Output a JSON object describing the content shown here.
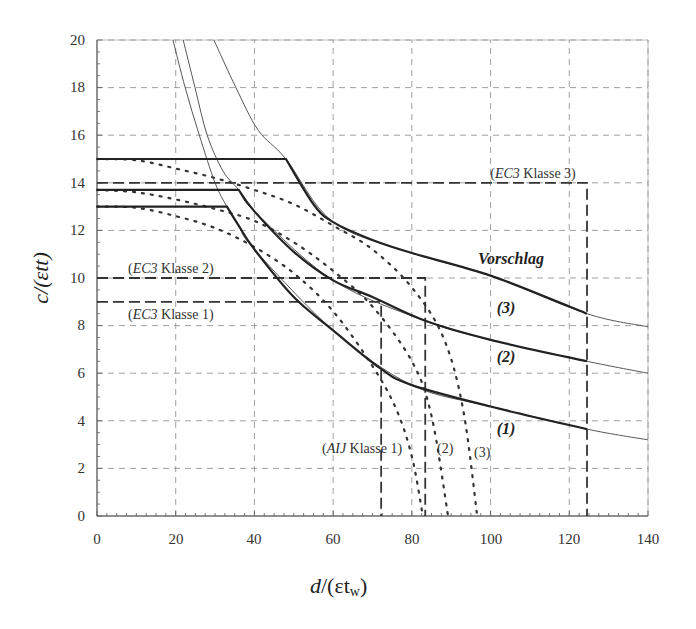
{
  "chart_data": {
    "type": "line",
    "title": "",
    "xlabel": "d/(ε t_w)",
    "ylabel": "c/(ε t f)",
    "xlim": [
      0,
      140
    ],
    "ylim": [
      0,
      20
    ],
    "xticks": [
      0,
      20,
      40,
      60,
      80,
      100,
      120,
      140
    ],
    "yticks": [
      0,
      2,
      4,
      6,
      8,
      10,
      12,
      14,
      16,
      18,
      20
    ],
    "grid": true,
    "legend": "none (inline annotations)",
    "series": [
      {
        "name": "Vorschlag (1)",
        "style": "thick solid",
        "x": [
          0,
          33,
          36,
          40,
          50,
          60,
          72,
          80,
          100,
          124.5
        ],
        "y": [
          13,
          13,
          12.2,
          11.2,
          9.2,
          7.8,
          6.2,
          5.5,
          4.6,
          3.65
        ]
      },
      {
        "name": "Vorschlag (2)",
        "style": "thick solid",
        "x": [
          0,
          36,
          40,
          50,
          60,
          70,
          83.4,
          100,
          124.5
        ],
        "y": [
          13.7,
          13.7,
          12.8,
          11.1,
          9.9,
          9.2,
          8.2,
          7.4,
          6.5
        ]
      },
      {
        "name": "Vorschlag (3)",
        "style": "thick solid",
        "x": [
          0,
          48,
          55,
          60,
          70,
          80,
          100,
          120,
          124.5
        ],
        "y": [
          15,
          15,
          13.1,
          12.35,
          11.6,
          11.05,
          10.1,
          8.8,
          8.5
        ]
      },
      {
        "name": "thin curve 1 (extension)",
        "style": "thin solid",
        "x": [
          19.3,
          22.4,
          26,
          30,
          33,
          36,
          40,
          60,
          80,
          100,
          124.5,
          140
        ],
        "y": [
          20,
          18,
          16,
          14,
          13,
          12.2,
          11.2,
          7.8,
          5.5,
          4.6,
          3.65,
          3.2
        ]
      },
      {
        "name": "thin curve 2 (extension)",
        "style": "thin solid",
        "x": [
          21.9,
          24.9,
          28,
          32,
          36,
          40,
          60,
          83.4,
          100,
          124.5,
          140
        ],
        "y": [
          20,
          18,
          16,
          14.5,
          13.7,
          12.8,
          9.9,
          8.2,
          7.4,
          6.5,
          6.0
        ]
      },
      {
        "name": "thin curve 3 (extension)",
        "style": "thin solid",
        "x": [
          29.7,
          35.3,
          41,
          48,
          60,
          80,
          100,
          124.5,
          140
        ],
        "y": [
          20,
          18,
          16.2,
          15,
          12.35,
          11.05,
          10.1,
          8.5,
          7.95
        ]
      },
      {
        "name": "AIJ Klasse 1",
        "style": "dotted",
        "x": [
          0,
          10,
          20,
          30,
          40,
          50,
          60,
          70,
          76,
          80,
          82.8
        ],
        "y": [
          13,
          12.95,
          12.6,
          12.1,
          11.3,
          10.2,
          8.6,
          6.3,
          4.5,
          2.5,
          0
        ]
      },
      {
        "name": "AIJ (2)",
        "style": "dotted",
        "x": [
          0,
          10,
          20,
          30,
          40,
          50,
          60,
          70,
          80,
          85,
          89.2
        ],
        "y": [
          13.7,
          13.6,
          13.3,
          12.9,
          12.4,
          11.5,
          10.3,
          8.8,
          6.5,
          4.2,
          0
        ]
      },
      {
        "name": "AIJ (3)",
        "style": "dotted",
        "x": [
          0,
          10,
          20,
          30,
          40,
          50,
          60,
          70,
          80,
          88,
          93,
          96.6
        ],
        "y": [
          15,
          14.95,
          14.6,
          14.2,
          13.7,
          13.1,
          12.2,
          11.2,
          9.6,
          7.5,
          4.5,
          0
        ]
      },
      {
        "name": "EC3 Klasse 1",
        "style": "dashed",
        "x": [
          0,
          72.2,
          72.2
        ],
        "y": [
          9,
          9,
          0
        ]
      },
      {
        "name": "EC3 Klasse 2",
        "style": "dashed",
        "x": [
          0,
          83.4,
          83.4
        ],
        "y": [
          10,
          10,
          0
        ]
      },
      {
        "name": "EC3 Klasse 3",
        "style": "dashed",
        "x": [
          0,
          124.5,
          124.5
        ],
        "y": [
          14,
          14,
          0
        ]
      }
    ],
    "annotations": [
      {
        "text": "(EC3 Klasse 3)",
        "x": 111,
        "y": 14.6
      },
      {
        "text": "(EC3 Klasse 2)",
        "x": 8,
        "y": 10.4
      },
      {
        "text": "(EC3 Klasse 1)",
        "x": 8,
        "y": 8.2
      },
      {
        "text": "Vorschlag",
        "x": 105,
        "y": 10.9
      },
      {
        "text": "(3)",
        "x": 102,
        "y": 8.7
      },
      {
        "text": "(2)",
        "x": 102,
        "y": 6.7
      },
      {
        "text": "(1)",
        "x": 102,
        "y": 3.8
      },
      {
        "text": "(AIJ Klasse 1)",
        "x": 60,
        "y": 2.7
      },
      {
        "text": "(2)",
        "x": 88,
        "y": 2.7
      },
      {
        "text": "(3)",
        "x": 95,
        "y": 2.5
      }
    ]
  },
  "labels": {
    "ylabel_main": "c",
    "ylabel_rest": "/(εtt)",
    "xlabel_main": "d",
    "xlabel_rest": "/(εt",
    "xlabel_sub": "w",
    "xlabel_close": ")",
    "ec3_3_paren_open": "(",
    "ec3_3_name": "EC3",
    "ec3_3_rest": " Klasse 3)",
    "ec3_2_paren_open": "(",
    "ec3_2_name": "EC3",
    "ec3_2_rest": " Klasse 2)",
    "ec3_1_paren_open": "(",
    "ec3_1_name": "EC3",
    "ec3_1_rest": " Klasse 1)",
    "vorschlag": "Vorschlag",
    "curve3": "(3)",
    "curve2": "(2)",
    "curve1": "(1)",
    "aij_paren_open": "(",
    "aij_name": "AIJ",
    "aij_rest": " Klasse 1)",
    "aij2": "(2)",
    "aij3": "(3)",
    "xt0": "0",
    "xt20": "20",
    "xt40": "40",
    "xt60": "60",
    "xt80": "80",
    "xt100": "100",
    "xt120": "120",
    "xt140": "140",
    "yt0": "0",
    "yt2": "2",
    "yt4": "4",
    "yt6": "6",
    "yt8": "8",
    "yt10": "10",
    "yt12": "12",
    "yt14": "14",
    "yt16": "16",
    "yt18": "18",
    "yt20": "20"
  }
}
